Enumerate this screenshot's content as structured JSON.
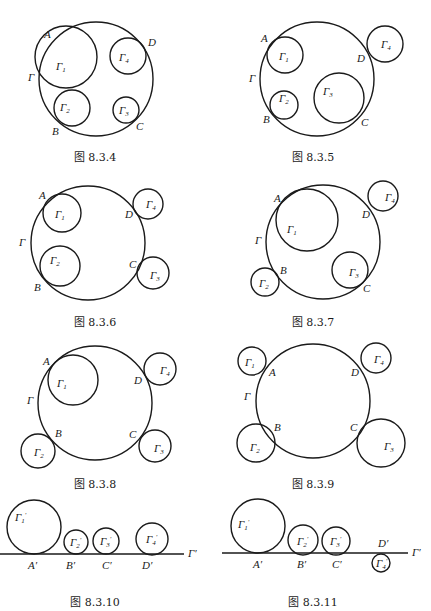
{
  "figures": [
    {
      "id": "fig-8-3-4",
      "caption": "图 8.3.4",
      "caption_pos": [
        95,
        161
      ],
      "circles": [
        {
          "name": "Γ",
          "cx": 96,
          "cy": 79,
          "r": 57
        },
        {
          "name": "Γ1",
          "cx": 66,
          "cy": 57,
          "r": 31,
          "label": "Γ",
          "sub": "1",
          "lx": 56,
          "ly": 70
        },
        {
          "name": "Γ2",
          "cx": 72,
          "cy": 108,
          "r": 18,
          "label": "Γ",
          "sub": "2",
          "lx": 60,
          "ly": 111
        },
        {
          "name": "Γ3",
          "cx": 126,
          "cy": 110,
          "r": 13,
          "label": "Γ",
          "sub": "3",
          "lx": 119,
          "ly": 114
        },
        {
          "name": "Γ4",
          "cx": 128,
          "cy": 56,
          "r": 18,
          "label": "Γ",
          "sub": "4",
          "lx": 119,
          "ly": 61
        }
      ],
      "lines": [],
      "points": [
        {
          "label": "A",
          "x": 44,
          "y": 38
        },
        {
          "label": "B",
          "x": 52,
          "y": 135
        },
        {
          "label": "C",
          "x": 136,
          "y": 130
        },
        {
          "label": "D",
          "x": 148,
          "y": 46
        },
        {
          "label": "Γ",
          "x": 28,
          "y": 81
        }
      ]
    },
    {
      "id": "fig-8-3-5",
      "caption": "图 8.3.5",
      "caption_pos": [
        313,
        161
      ],
      "circles": [
        {
          "name": "Γ",
          "cx": 317,
          "cy": 79,
          "r": 57
        },
        {
          "name": "Γ1",
          "cx": 285,
          "cy": 55,
          "r": 18,
          "label": "Γ",
          "sub": "1",
          "lx": 279,
          "ly": 60
        },
        {
          "name": "Γ2",
          "cx": 284,
          "cy": 105,
          "r": 14,
          "label": "Γ",
          "sub": "2",
          "lx": 279,
          "ly": 102
        },
        {
          "name": "Γ3",
          "cx": 339,
          "cy": 98,
          "r": 25,
          "label": "Γ",
          "sub": "3",
          "lx": 323,
          "ly": 95
        },
        {
          "name": "Γ4",
          "cx": 385,
          "cy": 44,
          "r": 18,
          "label": "Γ",
          "sub": "4",
          "lx": 381,
          "ly": 48
        }
      ],
      "lines": [],
      "points": [
        {
          "label": "A",
          "x": 261,
          "y": 42
        },
        {
          "label": "B",
          "x": 263,
          "y": 123
        },
        {
          "label": "C",
          "x": 361,
          "y": 126
        },
        {
          "label": "D",
          "x": 357,
          "y": 62
        },
        {
          "label": "Γ",
          "x": 249,
          "y": 82
        }
      ]
    },
    {
      "id": "fig-8-3-6",
      "caption": "图 8.3.6",
      "caption_pos": [
        95,
        326
      ],
      "circles": [
        {
          "name": "Γ",
          "cx": 88,
          "cy": 243,
          "r": 57
        },
        {
          "name": "Γ1",
          "cx": 62,
          "cy": 213,
          "r": 19,
          "label": "Γ",
          "sub": "1",
          "lx": 55,
          "ly": 218
        },
        {
          "name": "Γ2",
          "cx": 60,
          "cy": 266,
          "r": 20,
          "label": "Γ",
          "sub": "2",
          "lx": 50,
          "ly": 264
        },
        {
          "name": "Γ3",
          "cx": 153,
          "cy": 273,
          "r": 16,
          "label": "Γ",
          "sub": "3",
          "lx": 150,
          "ly": 279
        },
        {
          "name": "Γ4",
          "cx": 148,
          "cy": 204,
          "r": 15,
          "label": "Γ",
          "sub": "4",
          "lx": 146,
          "ly": 208
        }
      ],
      "lines": [],
      "points": [
        {
          "label": "A",
          "x": 39,
          "y": 199
        },
        {
          "label": "B",
          "x": 34,
          "y": 291
        },
        {
          "label": "C",
          "x": 129,
          "y": 268
        },
        {
          "label": "D",
          "x": 125,
          "y": 218
        },
        {
          "label": "Γ",
          "x": 19,
          "y": 246
        }
      ]
    },
    {
      "id": "fig-8-3-7",
      "caption": "图 8.3.7",
      "caption_pos": [
        313,
        326
      ],
      "circles": [
        {
          "name": "Γ",
          "cx": 323,
          "cy": 242,
          "r": 57
        },
        {
          "name": "Γ1",
          "cx": 307,
          "cy": 220,
          "r": 31,
          "label": "Γ",
          "sub": "1",
          "lx": 287,
          "ly": 233
        },
        {
          "name": "Γ2",
          "cx": 265,
          "cy": 282,
          "r": 14,
          "label": "Γ",
          "sub": "2",
          "lx": 259,
          "ly": 287
        },
        {
          "name": "Γ3",
          "cx": 350,
          "cy": 270,
          "r": 18,
          "label": "Γ",
          "sub": "3",
          "lx": 349,
          "ly": 276
        },
        {
          "name": "Γ4",
          "cx": 383,
          "cy": 196,
          "r": 15,
          "label": "Γ",
          "sub": "4",
          "lx": 385,
          "ly": 201
        }
      ],
      "lines": [],
      "points": [
        {
          "label": "A",
          "x": 274,
          "y": 202
        },
        {
          "label": "B",
          "x": 280,
          "y": 274
        },
        {
          "label": "C",
          "x": 363,
          "y": 292
        },
        {
          "label": "D",
          "x": 362,
          "y": 218
        },
        {
          "label": "Γ",
          "x": 255,
          "y": 244
        }
      ]
    },
    {
      "id": "fig-8-3-8",
      "caption": "图 8.3.8",
      "caption_pos": [
        95,
        488
      ],
      "circles": [
        {
          "name": "Γ",
          "cx": 95,
          "cy": 403,
          "r": 57
        },
        {
          "name": "Γ1",
          "cx": 73,
          "cy": 380,
          "r": 25,
          "label": "Γ",
          "sub": "1",
          "lx": 57,
          "ly": 387
        },
        {
          "name": "Γ2",
          "cx": 38,
          "cy": 451,
          "r": 17,
          "label": "Γ",
          "sub": "2",
          "lx": 34,
          "ly": 456
        },
        {
          "name": "Γ3",
          "cx": 155,
          "cy": 446,
          "r": 16,
          "label": "Γ",
          "sub": "3",
          "lx": 154,
          "ly": 452
        },
        {
          "name": "Γ4",
          "cx": 160,
          "cy": 369,
          "r": 16,
          "label": "Γ",
          "sub": "4",
          "lx": 160,
          "ly": 374
        }
      ],
      "lines": [],
      "points": [
        {
          "label": "A",
          "x": 43,
          "y": 365
        },
        {
          "label": "B",
          "x": 55,
          "y": 437
        },
        {
          "label": "C",
          "x": 129,
          "y": 438
        },
        {
          "label": "D",
          "x": 134,
          "y": 384
        },
        {
          "label": "Γ",
          "x": 27,
          "y": 404
        }
      ]
    },
    {
      "id": "fig-8-3-9",
      "caption": "图 8.3.9",
      "caption_pos": [
        313,
        488
      ],
      "circles": [
        {
          "name": "Γ",
          "cx": 313,
          "cy": 401,
          "r": 57
        },
        {
          "name": "Γ1",
          "cx": 252,
          "cy": 361,
          "r": 14,
          "label": "Γ",
          "sub": "1",
          "lx": 245,
          "ly": 366
        },
        {
          "name": "Γ2",
          "cx": 256,
          "cy": 443,
          "r": 19,
          "label": "Γ",
          "sub": "2",
          "lx": 250,
          "ly": 451
        },
        {
          "name": "Γ3",
          "cx": 381,
          "cy": 443,
          "r": 24,
          "label": "Γ",
          "sub": "3",
          "lx": 384,
          "ly": 450
        },
        {
          "name": "Γ4",
          "cx": 376,
          "cy": 358,
          "r": 15,
          "label": "Γ",
          "sub": "4",
          "lx": 374,
          "ly": 363
        }
      ],
      "lines": [],
      "points": [
        {
          "label": "A",
          "x": 269,
          "y": 376
        },
        {
          "label": "B",
          "x": 274,
          "y": 431
        },
        {
          "label": "C",
          "x": 350,
          "y": 431
        },
        {
          "label": "D",
          "x": 351,
          "y": 376
        },
        {
          "label": "Γ",
          "x": 244,
          "y": 400
        }
      ]
    },
    {
      "id": "fig-8-3-10",
      "caption": "图 8.3.10",
      "caption_pos": [
        95,
        606
      ],
      "circles": [
        {
          "name": "Γ1'",
          "cx": 34,
          "cy": 527,
          "r": 27,
          "label": "Γ",
          "sub": "1",
          "prime": true,
          "lx": 15,
          "ly": 521
        },
        {
          "name": "Γ2'",
          "cx": 76,
          "cy": 542,
          "r": 12,
          "label": "Γ",
          "sub": "2",
          "prime": true,
          "lx": 70,
          "ly": 546
        },
        {
          "name": "Γ3'",
          "cx": 106,
          "cy": 541,
          "r": 13,
          "label": "Γ",
          "sub": "3",
          "prime": true,
          "lx": 100,
          "ly": 545
        },
        {
          "name": "Γ4'",
          "cx": 152,
          "cy": 539,
          "r": 16,
          "label": "Γ",
          "sub": "4",
          "prime": true,
          "lx": 146,
          "ly": 543
        }
      ],
      "lines": [
        {
          "name": "Γ'",
          "x1": 0,
          "y1": 554,
          "x2": 184,
          "y2": 554
        }
      ],
      "points": [
        {
          "label": "A'",
          "x": 28,
          "y": 569
        },
        {
          "label": "B'",
          "x": 66,
          "y": 569
        },
        {
          "label": "C'",
          "x": 102,
          "y": 569
        },
        {
          "label": "D'",
          "x": 142,
          "y": 569
        },
        {
          "label": "Γ'",
          "x": 188,
          "y": 557
        }
      ]
    },
    {
      "id": "fig-8-3-11",
      "caption": "图 8.3.11",
      "caption_pos": [
        313,
        606
      ],
      "circles": [
        {
          "name": "Γ1'",
          "cx": 258,
          "cy": 526,
          "r": 27,
          "label": "Γ",
          "sub": "1",
          "prime": true,
          "lx": 238,
          "ly": 528
        },
        {
          "name": "Γ2'",
          "cx": 303,
          "cy": 540,
          "r": 15,
          "label": "Γ",
          "sub": "2",
          "prime": true,
          "lx": 297,
          "ly": 545
        },
        {
          "name": "Γ3'",
          "cx": 336,
          "cy": 541,
          "r": 14,
          "label": "Γ",
          "sub": "3",
          "prime": true,
          "lx": 330,
          "ly": 545
        },
        {
          "name": "Γ4'",
          "cx": 381,
          "cy": 563,
          "r": 9,
          "label": "Γ",
          "sub": "4",
          "prime": true,
          "lx": 376,
          "ly": 567
        }
      ],
      "lines": [
        {
          "name": "Γ'",
          "x1": 222,
          "y1": 553,
          "x2": 408,
          "y2": 553
        }
      ],
      "points": [
        {
          "label": "A'",
          "x": 253,
          "y": 568
        },
        {
          "label": "B'",
          "x": 297,
          "y": 568
        },
        {
          "label": "C'",
          "x": 332,
          "y": 568
        },
        {
          "label": "D'",
          "x": 378,
          "y": 547
        },
        {
          "label": "Γ'",
          "x": 412,
          "y": 556
        }
      ]
    }
  ]
}
